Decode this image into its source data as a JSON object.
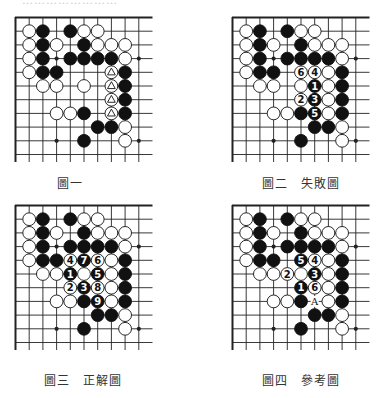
{
  "header": {
    "clipped_text": "……………………"
  },
  "grid": {
    "cell": 13.7,
    "stone_radius": 6.4,
    "vertical_lines": 10,
    "horizontal_lines": 11,
    "line_extent_x": 137,
    "line_extent_y": 145,
    "star_points": [
      [
        3,
        3
      ],
      [
        9,
        3
      ],
      [
        3,
        9
      ],
      [
        9,
        9
      ]
    ]
  },
  "colors": {
    "black": "#111111",
    "white": "#ffffff",
    "line": "#222222"
  },
  "base_stones": {
    "black": [
      [
        2,
        1
      ],
      [
        4,
        1
      ],
      [
        2,
        2
      ],
      [
        5,
        2
      ],
      [
        2,
        3
      ],
      [
        4,
        3
      ],
      [
        5,
        3
      ],
      [
        6,
        3
      ],
      [
        7,
        3
      ],
      [
        2,
        4
      ],
      [
        3,
        4
      ],
      [
        8,
        4
      ],
      [
        8,
        5
      ],
      [
        8,
        6
      ],
      [
        5,
        7
      ],
      [
        8,
        7
      ],
      [
        6,
        8
      ],
      [
        7,
        8
      ],
      [
        5,
        9
      ]
    ],
    "white": [
      [
        1,
        1
      ],
      [
        5,
        1
      ],
      [
        6,
        1
      ],
      [
        1,
        2
      ],
      [
        3,
        2
      ],
      [
        6,
        2
      ],
      [
        7,
        2
      ],
      [
        8,
        2
      ],
      [
        1,
        3
      ],
      [
        8,
        3
      ],
      [
        1,
        4
      ],
      [
        2,
        5
      ],
      [
        3,
        5
      ],
      [
        5,
        5
      ],
      [
        3,
        7
      ],
      [
        4,
        7
      ],
      [
        8,
        8
      ],
      [
        8,
        9
      ]
    ]
  },
  "boards": [
    {
      "id": "fig1",
      "caption": "圖一",
      "origin": [
        15,
        17
      ],
      "extra_white": [],
      "extra_black": [],
      "triangle_white": [
        [
          7,
          4
        ],
        [
          7,
          5
        ],
        [
          7,
          6
        ],
        [
          7,
          7
        ]
      ],
      "numbered": [],
      "labels": [],
      "remove": []
    },
    {
      "id": "fig2",
      "caption": "圖二　失敗圖",
      "origin": [
        232,
        17
      ],
      "extra_white": [
        [
          7,
          4
        ],
        [
          7,
          5
        ],
        [
          7,
          6
        ],
        [
          7,
          7
        ]
      ],
      "extra_black": [],
      "triangle_white": [],
      "numbered": [
        {
          "pos": [
            6,
            5
          ],
          "color": "black",
          "n": "1"
        },
        {
          "pos": [
            5,
            6
          ],
          "color": "white",
          "n": "2"
        },
        {
          "pos": [
            6,
            6
          ],
          "color": "black",
          "n": "3"
        },
        {
          "pos": [
            6,
            4
          ],
          "color": "white",
          "n": "4"
        },
        {
          "pos": [
            6,
            7
          ],
          "color": "black",
          "n": "5"
        },
        {
          "pos": [
            5,
            4
          ],
          "color": "white",
          "n": "6"
        }
      ],
      "labels": [],
      "remove": []
    },
    {
      "id": "fig3",
      "caption": "圖三　正解圖",
      "origin": [
        15,
        205
      ],
      "extra_white": [
        [
          7,
          4
        ],
        [
          7,
          5
        ],
        [
          7,
          6
        ],
        [
          7,
          7
        ]
      ],
      "extra_black": [],
      "triangle_white": [],
      "numbered": [
        {
          "pos": [
            4,
            5
          ],
          "color": "black",
          "n": "1"
        },
        {
          "pos": [
            4,
            6
          ],
          "color": "white",
          "n": "2"
        },
        {
          "pos": [
            5,
            6
          ],
          "color": "black",
          "n": "3"
        },
        {
          "pos": [
            4,
            4
          ],
          "color": "white",
          "n": "4"
        },
        {
          "pos": [
            6,
            5
          ],
          "color": "black",
          "n": "5"
        },
        {
          "pos": [
            6,
            4
          ],
          "color": "white",
          "n": "6"
        },
        {
          "pos": [
            5,
            4
          ],
          "color": "black",
          "n": "7"
        },
        {
          "pos": [
            6,
            6
          ],
          "color": "white",
          "n": "8"
        },
        {
          "pos": [
            6,
            7
          ],
          "color": "black",
          "n": "9"
        }
      ],
      "labels": [],
      "remove": []
    },
    {
      "id": "fig4",
      "caption": "圖四　參考圖",
      "origin": [
        232,
        205
      ],
      "extra_white": [
        [
          7,
          4
        ],
        [
          7,
          5
        ],
        [
          7,
          6
        ],
        [
          7,
          7
        ]
      ],
      "extra_black": [],
      "triangle_white": [],
      "numbered": [
        {
          "pos": [
            5,
            6
          ],
          "color": "black",
          "n": "1"
        },
        {
          "pos": [
            4,
            5
          ],
          "color": "white",
          "n": "2"
        },
        {
          "pos": [
            6,
            5
          ],
          "color": "black",
          "n": "3"
        },
        {
          "pos": [
            6,
            4
          ],
          "color": "white",
          "n": "4"
        },
        {
          "pos": [
            5,
            4
          ],
          "color": "black",
          "n": "5"
        },
        {
          "pos": [
            6,
            6
          ],
          "color": "white",
          "n": "6"
        }
      ],
      "labels": [
        {
          "pos": [
            6,
            7
          ],
          "text": "A"
        }
      ],
      "remove": []
    }
  ],
  "captions": [
    {
      "text": "圖一",
      "x": 57,
      "y": 174
    },
    {
      "text": "圖二　失敗圖",
      "x": 262,
      "y": 174
    },
    {
      "text": "圖三　正解圖",
      "x": 44,
      "y": 371
    },
    {
      "text": "圖四　參考圖",
      "x": 262,
      "y": 371
    }
  ]
}
